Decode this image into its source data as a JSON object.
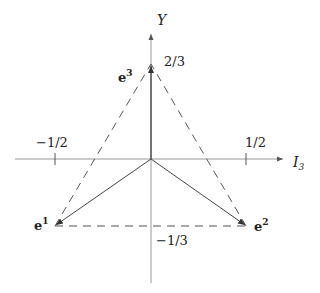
{
  "diagram": {
    "type": "weight-diagram",
    "axes": {
      "x_label": "I",
      "x_label_sub": "3",
      "y_label": "Y"
    },
    "ticks": {
      "x_neg": "−1/2",
      "x_pos": "1/2",
      "y_top": "2/3",
      "y_bottom": "−1/3"
    },
    "vectors": [
      {
        "name": "e",
        "sup": "1",
        "coords": [
          -0.5,
          -0.3333
        ]
      },
      {
        "name": "e",
        "sup": "2",
        "coords": [
          0.5,
          -0.3333
        ]
      },
      {
        "name": "e",
        "sup": "3",
        "coords": [
          0,
          0.6667
        ]
      }
    ],
    "colors": {
      "axis": "#888888",
      "vector": "#444444",
      "dashed": "#555555",
      "text": "#222222"
    }
  }
}
